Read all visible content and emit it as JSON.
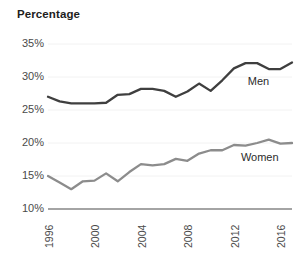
{
  "chart_data": {
    "type": "line",
    "title": "Percentage",
    "xlabel": "",
    "ylabel": "",
    "ylim": [
      10,
      35
    ],
    "xlim": [
      1996,
      2017
    ],
    "grid": true,
    "legend_position": "inline-right",
    "y_ticks": [
      "35%",
      "30%",
      "25%",
      "20%",
      "15%",
      "10%"
    ],
    "y_tick_values": [
      35,
      30,
      25,
      20,
      15,
      10
    ],
    "x_ticks": [
      "1996",
      "2000",
      "2004",
      "2008",
      "2012",
      "2016"
    ],
    "x_tick_values": [
      1996,
      2000,
      2004,
      2008,
      2012,
      2016
    ],
    "x": [
      1996,
      1997,
      1998,
      1999,
      2000,
      2001,
      2002,
      2003,
      2004,
      2005,
      2006,
      2007,
      2008,
      2009,
      2010,
      2011,
      2012,
      2013,
      2014,
      2015,
      2016,
      2017
    ],
    "series": [
      {
        "name": "Men",
        "color": "#3f3f3f",
        "label_x": 2013.2,
        "label_y": 29.3,
        "values": [
          27.0,
          26.3,
          26.0,
          26.0,
          26.0,
          26.1,
          27.3,
          27.4,
          28.2,
          28.2,
          27.9,
          27.0,
          27.8,
          29.0,
          27.9,
          29.5,
          31.3,
          32.1,
          32.1,
          31.2,
          31.2,
          32.2
        ]
      },
      {
        "name": "Women",
        "color": "#8c8c8c",
        "label_x": 2012.6,
        "label_y": 17.7,
        "values": [
          15.0,
          14.0,
          13.0,
          14.2,
          14.3,
          15.4,
          14.2,
          15.6,
          16.8,
          16.6,
          16.8,
          17.6,
          17.3,
          18.4,
          18.9,
          18.9,
          19.7,
          19.6,
          20.0,
          20.5,
          19.9,
          20.0
        ]
      }
    ]
  },
  "axis": {
    "baseline_color": "#4a4a4a",
    "gridline_color": "#f2f2f2"
  }
}
